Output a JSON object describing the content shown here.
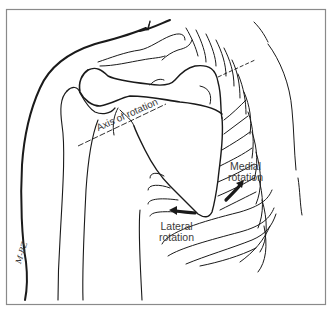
{
  "figure": {
    "labels": {
      "axis": "Axis of rotation",
      "medial_line1": "Medial",
      "medial_line2": "rotation",
      "lateral_line1": "Lateral",
      "lateral_line2": "rotation"
    },
    "signature": "M-BZ",
    "colors": {
      "line": "#1a1a1a",
      "frame": "#8a8a8a",
      "text": "#3a3a3a",
      "background": "#ffffff"
    },
    "icons": {
      "medial_arrow": "curved-arrow-up-right-icon",
      "lateral_arrow": "arrow-left-icon"
    }
  }
}
